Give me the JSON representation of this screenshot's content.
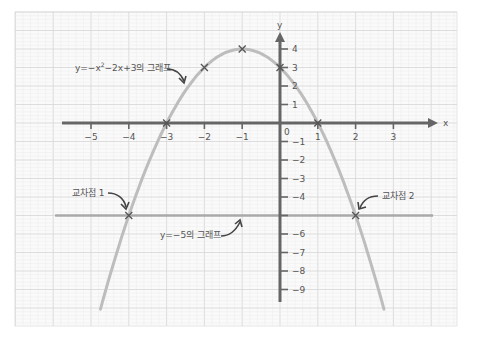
{
  "chart_data": {
    "type": "line",
    "title": "",
    "xlabel": "x",
    "ylabel": "y",
    "origin_label": "0",
    "xlim": [
      -5.5,
      4
    ],
    "ylim": [
      -10,
      4.8
    ],
    "grid": true,
    "x_ticks": [
      -5,
      -4,
      -3,
      -2,
      -1,
      1,
      2,
      3
    ],
    "x_tick_labels": [
      "−5",
      "−4",
      "−3",
      "−2",
      "−1",
      "1",
      "2",
      "3"
    ],
    "y_ticks": [
      4,
      3,
      2,
      1,
      -1,
      -2,
      -3,
      -4,
      -5,
      -6,
      -7,
      -8,
      -9
    ],
    "y_tick_labels": [
      "4",
      "3",
      "2",
      "1",
      "−1",
      "−2",
      "−3",
      "−4",
      "",
      "−6",
      "−7",
      "−8",
      "−9"
    ],
    "series": [
      {
        "name": "y=−x²−2x+3의 그래프",
        "kind": "curve",
        "equation": "y = -x^2 - 2x + 3",
        "x_range": [
          -4.75,
          2.75
        ],
        "marked_points": [
          [
            -3,
            0
          ],
          [
            -2,
            3
          ],
          [
            -1,
            4
          ],
          [
            0,
            3
          ],
          [
            1,
            0
          ]
        ]
      },
      {
        "name": "y=−5의 그래프",
        "kind": "horizontal-line",
        "equation": "y = -5",
        "x_range": [
          -5.95,
          4.05
        ]
      }
    ],
    "intersections": [
      {
        "label": "교차점 1",
        "x": -4,
        "y": -5
      },
      {
        "label": "교차점 2",
        "x": 2,
        "y": -5
      }
    ],
    "annotations": [
      {
        "text": "y=−x²−2x+3의 그래프",
        "target": "parabola"
      },
      {
        "text": "y=−5의 그래프",
        "target": "line y=-5"
      },
      {
        "text": "교차점 1",
        "target": "(-4,-5)"
      },
      {
        "text": "교차점 2",
        "target": "(2,-5)"
      }
    ]
  },
  "labels": {
    "parabola_label_prefix": "y=−x",
    "parabola_label_sup": "2",
    "parabola_label_suffix": "−2x+3의 그래프",
    "line_label": "y=−5의 그래프",
    "intersection1": "교차점 1",
    "intersection2": "교차점 2",
    "x_axis": "x",
    "y_axis": "y",
    "origin": "0"
  },
  "colors": {
    "axis": "#666666",
    "curve": "#bdbdbd",
    "line": "#a9a9a9",
    "grid_major": "#d9d9d9",
    "grid_minor": "#ececec",
    "marker": "#555555",
    "text": "#555555"
  }
}
